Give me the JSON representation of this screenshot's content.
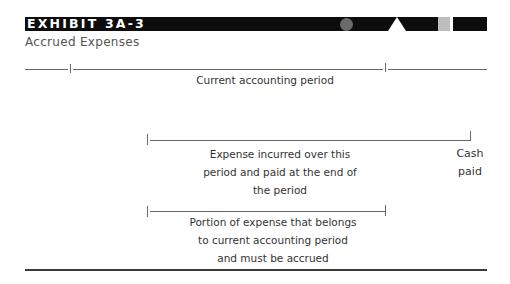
{
  "exhibit": {
    "label": "EXHIBIT 3A-3",
    "title": "Accrued Expenses"
  },
  "timeline": {
    "period_label": "Current accounting period"
  },
  "expense_span": {
    "label_lines": [
      "Expense incurred over this",
      "period and paid at the end of",
      "the period"
    ],
    "end_label_lines": [
      "Cash",
      "paid"
    ]
  },
  "accrual_span": {
    "label_lines": [
      "Portion of expense that belongs",
      "to current accounting period",
      "and must be accrued"
    ]
  },
  "colors": {
    "header_bar": "#0d0d0d",
    "circle": "#6b6b6b",
    "square": "#bdbdbd",
    "line": "#6a6a6a",
    "text": "#333333"
  }
}
